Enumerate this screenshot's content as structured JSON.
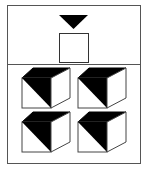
{
  "puzzle": {
    "question_panel": {
      "items": [
        {
          "shape": "triangle-down",
          "fill": "#000000"
        },
        {
          "shape": "square",
          "fill": "#ffffff",
          "stroke": "#000000"
        }
      ]
    },
    "answer_panel": {
      "options": [
        {
          "shape": "cube",
          "top_face": "black",
          "front_face": "diagonal-half-black",
          "right_face": "white"
        },
        {
          "shape": "cube",
          "top_face": "black",
          "front_face": "diagonal-half-black",
          "right_face": "white"
        },
        {
          "shape": "cube",
          "top_face": "black",
          "front_face": "diagonal-half-black",
          "right_face": "white"
        },
        {
          "shape": "cube",
          "top_face": "black",
          "front_face": "diagonal-half-black",
          "right_face": "white"
        }
      ]
    },
    "colors": {
      "border": "#555555",
      "fill": "#000000",
      "background": "#ffffff"
    }
  }
}
